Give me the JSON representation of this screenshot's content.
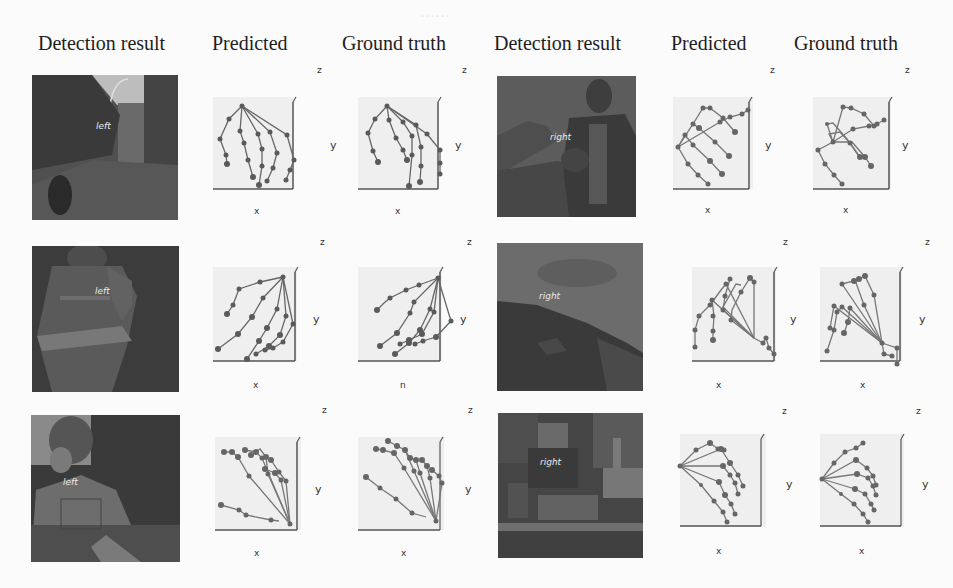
{
  "figure": {
    "column_headers": [
      {
        "label": "Detection result",
        "x": 38
      },
      {
        "label": "Predicted",
        "x": 212
      },
      {
        "label": "Ground truth",
        "x": 342
      },
      {
        "label": "Detection result",
        "x": 494
      },
      {
        "label": "Predicted",
        "x": 671
      },
      {
        "label": "Ground truth",
        "x": 794
      }
    ],
    "axis_labels": {
      "x": "x",
      "y": "y",
      "z": "z",
      "x_alt": "n"
    },
    "rows": [
      {
        "left": {
          "hand_label": "left",
          "photo_desc": "street scene with buildings"
        },
        "right": {
          "hand_label": "right",
          "photo_desc": "man in jacket"
        }
      },
      {
        "left": {
          "hand_label": "left",
          "photo_desc": "firefighter in gear"
        },
        "right": {
          "hand_label": "right",
          "photo_desc": "hillside with sky"
        }
      },
      {
        "left": {
          "hand_label": "left",
          "photo_desc": "person outdoors with trees"
        },
        "right": {
          "hand_label": "right",
          "photo_desc": "cluttered city scene"
        }
      }
    ]
  }
}
